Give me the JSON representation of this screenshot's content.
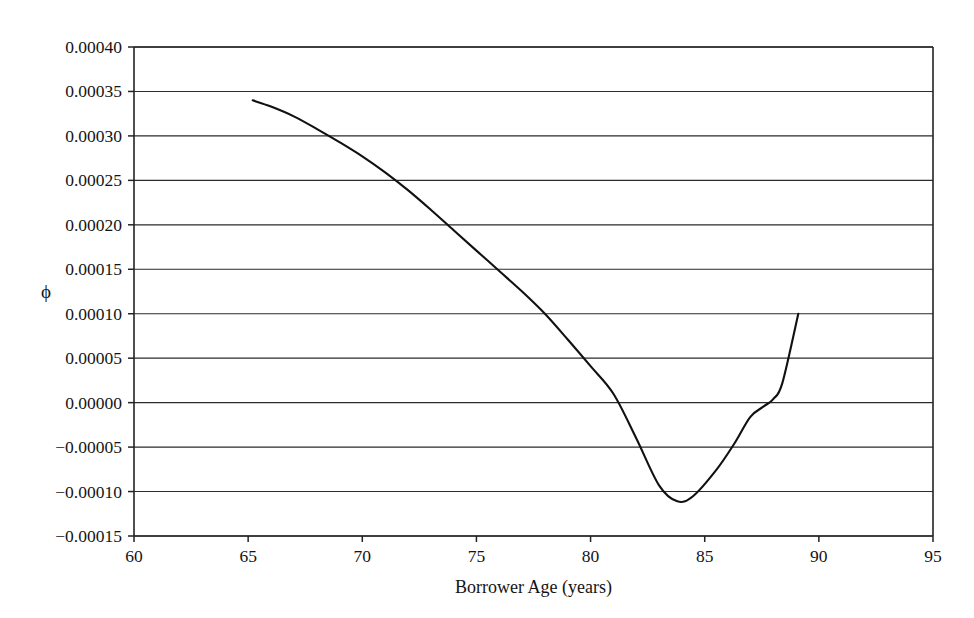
{
  "chart_data": {
    "type": "line",
    "title": "",
    "subtitle": "",
    "xlabel": "Borrower Age (years)",
    "ylabel": "ϕ",
    "xlim": [
      60,
      95
    ],
    "ylim": [
      -0.00015,
      0.0004
    ],
    "grid": "horizontal",
    "legend": "none",
    "x_ticks": [
      60,
      65,
      70,
      75,
      80,
      85,
      90,
      95
    ],
    "x_tick_labels": [
      "60",
      "65",
      "70",
      "75",
      "80",
      "85",
      "90",
      "95"
    ],
    "y_ticks": [
      0.0004,
      0.00035,
      0.0003,
      0.00025,
      0.0002,
      0.00015,
      0.0001,
      5e-05,
      0.0,
      -5e-05,
      -0.0001,
      -0.00015
    ],
    "y_tick_labels": [
      "0.00040",
      "0.00035",
      "0.00030",
      "0.00025",
      "0.00020",
      "0.00015",
      "0.00010",
      "0.00005",
      "0.00000",
      "−0.00005",
      "−0.00010",
      "−0.00015"
    ],
    "series": [
      {
        "name": "phi",
        "x": [
          65.2,
          66.0,
          67.0,
          68.0,
          69.0,
          70.0,
          71.0,
          72.0,
          73.0,
          74.0,
          75.0,
          76.0,
          77.0,
          78.0,
          79.0,
          80.0,
          81.0,
          82.0,
          83.0,
          83.8,
          84.5,
          85.5,
          86.3,
          87.0,
          87.6,
          88.0,
          88.4,
          89.1
        ],
        "values": [
          0.00034,
          0.000333,
          0.000322,
          0.000308,
          0.000293,
          0.000277,
          0.000259,
          0.000239,
          0.000217,
          0.000194,
          0.000171,
          0.000148,
          0.000125,
          0.0001,
          7.1e-05,
          4.1e-05,
          1e-05,
          -4e-05,
          -9.3e-05,
          -0.000111,
          -0.000105,
          -7.6e-05,
          -4.6e-05,
          -1.6e-05,
          -4e-06,
          4e-06,
          2.2e-05,
          0.0001
        ]
      }
    ],
    "annotations": [
      {
        "label": "minimum",
        "x": 83.8,
        "y": -0.000111
      },
      {
        "label": "curve-start",
        "x": 65.2,
        "y": 0.00034
      },
      {
        "label": "curve-end",
        "x": 89.1,
        "y": 0.0001
      }
    ]
  },
  "colors": {
    "background": "#ffffff",
    "line": "#111111",
    "grid": "#2b2b2b",
    "axis": "#232323",
    "text": "#141414"
  }
}
